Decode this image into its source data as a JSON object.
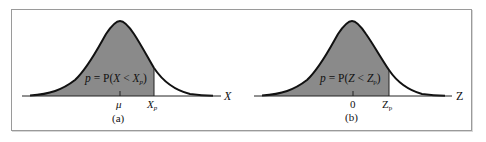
{
  "figure": {
    "panels": [
      {
        "id": "a",
        "caption": "(a)",
        "formula": {
          "p": "p",
          "eq": " = P(",
          "var": "X",
          "lt": " < ",
          "bound": "X",
          "sub": "p",
          "close": ")"
        },
        "axis_label": "X",
        "center_label": "μ",
        "bound_label": "X",
        "bound_sub": "p"
      },
      {
        "id": "b",
        "caption": "(b)",
        "formula": {
          "p": "p",
          "eq": " = P(",
          "var": "Z",
          "lt": " < ",
          "bound": "Z",
          "sub": "p",
          "close": ")"
        },
        "axis_label": "Z",
        "center_label": "0",
        "bound_label": "Z",
        "bound_sub": "p"
      }
    ],
    "colors": {
      "shade": "#8a8a8a",
      "curve": "#111111",
      "frame": "#9a9a9a"
    }
  }
}
